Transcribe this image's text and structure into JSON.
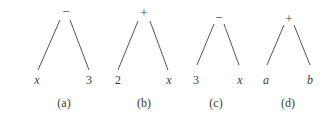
{
  "figure": {
    "trees": [
      {
        "caption": "(a)",
        "root": "−",
        "left": "x",
        "right": "3",
        "left_italic": true,
        "right_italic": false,
        "pos": {
          "root": [
            66,
            12
          ],
          "left": [
            37,
            80
          ],
          "right": [
            89,
            80
          ],
          "caption": [
            64,
            103
          ],
          "l1": [
            60,
            20,
            38,
            70
          ],
          "l2": [
            70,
            20,
            89,
            70
          ]
        }
      },
      {
        "caption": "(b)",
        "root": "+",
        "left": "2",
        "right": "x",
        "left_italic": false,
        "right_italic": true,
        "pos": {
          "root": [
            144,
            13
          ],
          "left": [
            118,
            80
          ],
          "right": [
            169,
            80
          ],
          "caption": [
            144,
            103
          ],
          "l1": [
            138,
            21,
            118,
            70
          ],
          "l2": [
            150,
            21,
            168,
            70
          ]
        }
      },
      {
        "caption": "(c)",
        "root": "−",
        "left": "3",
        "right": "x",
        "left_italic": false,
        "right_italic": true,
        "pos": {
          "root": [
            219,
            18
          ],
          "left": [
            196,
            80
          ],
          "right": [
            240,
            80
          ],
          "caption": [
            216,
            103
          ],
          "l1": [
            214,
            24,
            197,
            65
          ],
          "l2": [
            224,
            24,
            239,
            65
          ]
        }
      },
      {
        "caption": "(d)",
        "root": "+",
        "left": "a",
        "right": "b",
        "left_italic": true,
        "right_italic": true,
        "pos": {
          "root": [
            289,
            19
          ],
          "left": [
            266,
            80
          ],
          "right": [
            310,
            80
          ],
          "caption": [
            288,
            103
          ],
          "l1": [
            284,
            25,
            267,
            65
          ],
          "l2": [
            294,
            25,
            310,
            65
          ]
        }
      }
    ],
    "line_color": "#555555"
  }
}
